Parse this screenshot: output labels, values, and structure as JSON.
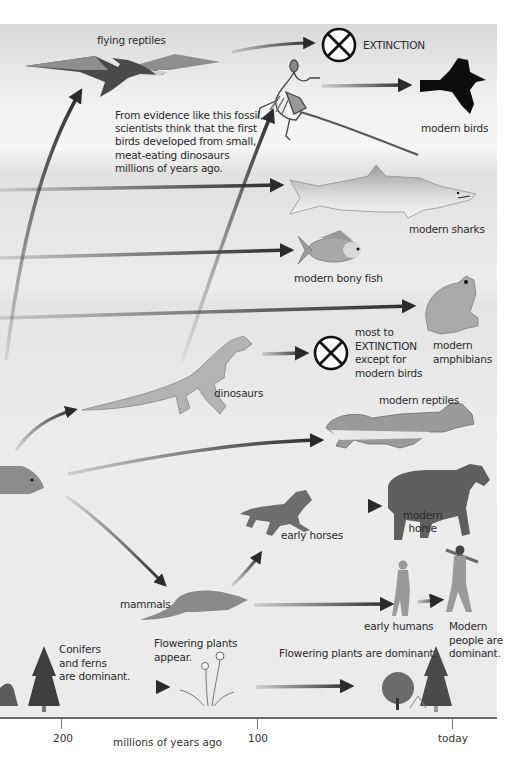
{
  "diagram": {
    "axis": {
      "label": "millions of years ago",
      "ticks": [
        {
          "label": "200",
          "x": 61
        },
        {
          "label": "100",
          "x": 257
        },
        {
          "label": "today",
          "x": 452
        }
      ]
    },
    "labels": {
      "flying_reptiles": "flying reptiles",
      "extinction_top": "EXTINCTION",
      "fossil_note_lines": [
        "From evidence like this fossil,",
        "scientists think that the first",
        "birds developed from small,",
        "meat-eating dinosaurs",
        "millions of years ago."
      ],
      "modern_birds": "modern birds",
      "modern_sharks": "modern sharks",
      "modern_bony_fish": "modern bony fish",
      "modern_amphibians_l1": "modern",
      "modern_amphibians_l2": "amphibians",
      "dino_extinction_lines": [
        "most to",
        "EXTINCTION",
        "except for",
        "modern birds"
      ],
      "dinosaurs": "dinosaurs",
      "modern_reptiles": "modern reptiles",
      "early_horses": "early horses",
      "modern_horse_l1": "modern",
      "modern_horse_l2": "horse",
      "mammals": "mammals",
      "early_humans": "early humans",
      "modern_people_lines": [
        "Modern",
        "people are",
        "dominant."
      ],
      "conifers_lines": [
        "Conifers",
        "and ferns",
        "are dominant."
      ],
      "flowering_appear_lines": [
        "Flowering plants",
        "appear."
      ],
      "flowering_dominant": "Flowering plants are dominant."
    },
    "icons": [
      "pterosaur-icon",
      "extinction-cross-icon",
      "archaeopteryx-fossil-icon",
      "bird-icon",
      "shark-icon",
      "fish-icon",
      "frog-icon",
      "tyrannosaurus-icon",
      "crocodile-icon",
      "early-horse-icon",
      "modern-horse-icon",
      "mammal-rodent-icon",
      "early-human-icon",
      "modern-human-icon",
      "reptile-ancestor-icon",
      "conifer-tree-icon",
      "flower-icon",
      "deciduous-tree-icon"
    ],
    "colors": {
      "arrow": "#2b2b2b",
      "panel_bg": "#ebebeb",
      "silhouette_dark": "#5a5a5a",
      "silhouette_mid": "#8c8c8c",
      "silhouette_light": "#b5b5b5"
    }
  }
}
